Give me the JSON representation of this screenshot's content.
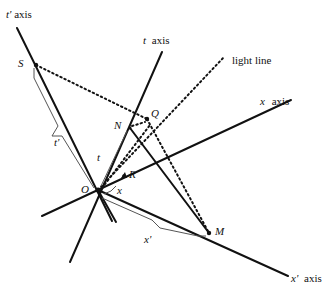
{
  "diagram": {
    "type": "spacetime-diagram",
    "axis_labels": {
      "t_prime_axis": {
        "symbol": "t'",
        "word": "axis"
      },
      "t_axis": {
        "symbol": "t",
        "word": "axis"
      },
      "x_axis": {
        "symbol": "x",
        "word": "axis"
      },
      "x_prime_axis": {
        "symbol": "x'",
        "word": "axis"
      }
    },
    "light_line_label": "light line",
    "points": {
      "S": "S",
      "Q": "Q",
      "N": "N",
      "O": "O",
      "R": "R",
      "M": "M"
    },
    "interval_labels": {
      "t_prime": "t'",
      "t": "t",
      "x": "x",
      "x_prime": "x'"
    },
    "colors": {
      "line": "#111111",
      "bracket": "#555555",
      "background": "#ffffff"
    }
  }
}
